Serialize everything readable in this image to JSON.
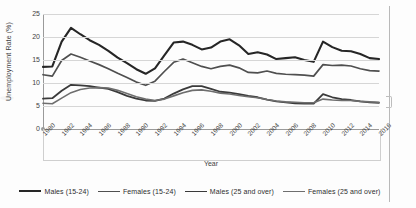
{
  "chart_data": {
    "type": "line",
    "title": "",
    "xlabel": "Year",
    "ylabel": "Unemployment Rate (%)",
    "ylim": [
      0,
      25
    ],
    "yticks": [
      0,
      5,
      10,
      15,
      20,
      25
    ],
    "xlim": [
      1980,
      2016
    ],
    "xticks": [
      1980,
      1982,
      1984,
      1986,
      1988,
      1990,
      1992,
      1994,
      1996,
      1998,
      2000,
      2002,
      2004,
      2006,
      2008,
      2010,
      2012,
      2014,
      2016
    ],
    "grid": true,
    "legend_position": "bottom",
    "x": [
      1980,
      1981,
      1982,
      1983,
      1984,
      1985,
      1986,
      1987,
      1988,
      1989,
      1990,
      1991,
      1992,
      1993,
      1994,
      1995,
      1996,
      1997,
      1998,
      1999,
      2000,
      2001,
      2002,
      2003,
      2004,
      2005,
      2006,
      2007,
      2008,
      2009,
      2010,
      2011,
      2012,
      2013,
      2014,
      2015,
      2016
    ],
    "series": [
      {
        "name": "Males (15-24)",
        "color": "#262626",
        "width": 2.1,
        "values": [
          13.5,
          13.6,
          19.0,
          22.0,
          20.6,
          19.3,
          18.3,
          17.0,
          15.5,
          14.3,
          13.0,
          12.0,
          13.2,
          16.0,
          18.8,
          19.0,
          18.3,
          17.3,
          17.7,
          19.0,
          19.5,
          18.2,
          16.3,
          16.7,
          16.2,
          15.2,
          15.4,
          15.6,
          15.0,
          14.6,
          19.0,
          17.8,
          17.0,
          16.9,
          16.3,
          15.4,
          15.2
        ]
      },
      {
        "name": "Females (15-24)",
        "color": "#4f4f4f",
        "width": 1.7,
        "values": [
          11.8,
          11.5,
          14.9,
          16.3,
          15.6,
          14.8,
          14.0,
          13.1,
          12.1,
          11.2,
          10.2,
          9.5,
          10.4,
          12.5,
          14.5,
          15.2,
          14.4,
          13.6,
          13.1,
          13.6,
          13.9,
          13.3,
          12.3,
          12.2,
          12.6,
          12.1,
          11.9,
          11.8,
          11.7,
          11.5,
          14.0,
          13.8,
          13.9,
          13.7,
          13.1,
          12.7,
          12.6
        ]
      },
      {
        "name": "Males (25 and over)",
        "color": "#3a3a3a",
        "width": 1.8,
        "values": [
          6.6,
          6.7,
          8.3,
          9.6,
          9.5,
          9.3,
          9.0,
          8.7,
          8.0,
          7.2,
          6.6,
          6.2,
          6.1,
          6.6,
          7.7,
          8.6,
          9.3,
          9.3,
          8.7,
          8.1,
          7.9,
          7.6,
          7.2,
          6.9,
          6.4,
          6.0,
          5.8,
          5.6,
          5.5,
          5.5,
          7.6,
          6.9,
          6.5,
          6.3,
          6.0,
          5.8,
          5.7
        ]
      },
      {
        "name": "Females (25 and over)",
        "color": "#6e6e6e",
        "width": 1.6,
        "values": [
          5.6,
          5.5,
          6.7,
          7.9,
          8.6,
          8.9,
          9.0,
          8.9,
          8.4,
          7.7,
          7.0,
          6.5,
          6.2,
          6.5,
          7.2,
          7.9,
          8.4,
          8.5,
          8.2,
          7.8,
          7.6,
          7.3,
          7.0,
          6.8,
          6.4,
          6.1,
          5.9,
          5.8,
          5.7,
          5.7,
          6.5,
          6.3,
          6.2,
          6.2,
          6.0,
          5.9,
          5.8
        ]
      }
    ]
  }
}
